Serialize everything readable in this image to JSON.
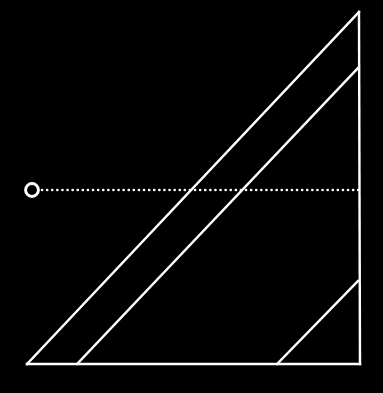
{
  "canvas": {
    "width": 383,
    "height": 393,
    "background_color": "#000000",
    "stroke_color": "#FFFFFF"
  },
  "figure": {
    "name": "right-triangle-with-parallel-diagonals-and-dotted-ray",
    "stroke_width": 2.4,
    "dotted_stroke_width": 2.6
  },
  "chart_data": {
    "type": "diagram",
    "title": "",
    "xlabel": "",
    "ylabel": "",
    "background_color": "#000000",
    "stroke_color": "#FFFFFF",
    "grid": false,
    "legend": false,
    "axis_ranges": {
      "x": [
        0,
        383
      ],
      "y": [
        0,
        393
      ]
    },
    "shapes": [
      {
        "id": "triangle-hypotenuse",
        "label": "hypotenuse",
        "type": "line",
        "x1": 27,
        "y1": 364,
        "x2": 359,
        "y2": 12,
        "stroke": "#FFFFFF",
        "stroke_width": 2.4,
        "dashed": false
      },
      {
        "id": "triangle-base",
        "label": "base",
        "type": "line",
        "x1": 27,
        "y1": 364,
        "x2": 360,
        "y2": 364,
        "stroke": "#FFFFFF",
        "stroke_width": 2.4,
        "dashed": false
      },
      {
        "id": "triangle-right-side",
        "label": "vertical-right-side",
        "type": "line",
        "x1": 359,
        "y1": 12,
        "x2": 360,
        "y2": 364,
        "stroke": "#FFFFFF",
        "stroke_width": 2.4,
        "dashed": false
      },
      {
        "id": "parallel-line-1",
        "label": "inner-parallel-diagonal-long",
        "type": "line",
        "x1": 77,
        "y1": 364,
        "x2": 358,
        "y2": 68,
        "stroke": "#FFFFFF",
        "stroke_width": 2.4,
        "dashed": false
      },
      {
        "id": "parallel-line-2",
        "label": "inner-parallel-diagonal-short",
        "type": "line",
        "x1": 277,
        "y1": 364,
        "x2": 358,
        "y2": 281,
        "stroke": "#FFFFFF",
        "stroke_width": 2.4,
        "dashed": false
      },
      {
        "id": "dotted-ray",
        "label": "horizontal-dotted-ray",
        "type": "line",
        "x1": 42,
        "y1": 190,
        "x2": 360,
        "y2": 190,
        "stroke": "#FFFFFF",
        "stroke_width": 2.6,
        "dashed": true,
        "dash_pattern": "0.1 5"
      },
      {
        "id": "circle-marker",
        "label": "hollow-circle-endpoint-marker",
        "type": "circle",
        "cx": 32,
        "cy": 190,
        "r": 6.4,
        "stroke": "#FFFFFF",
        "stroke_width": 3,
        "fill": "none"
      }
    ],
    "annotations": [],
    "intersections": [
      {
        "label": "hypotenuse-x-dotted-ray",
        "x": 192,
        "y": 190
      },
      {
        "label": "parallel-line-1-x-dotted-ray",
        "x": 243,
        "y": 190
      }
    ]
  }
}
